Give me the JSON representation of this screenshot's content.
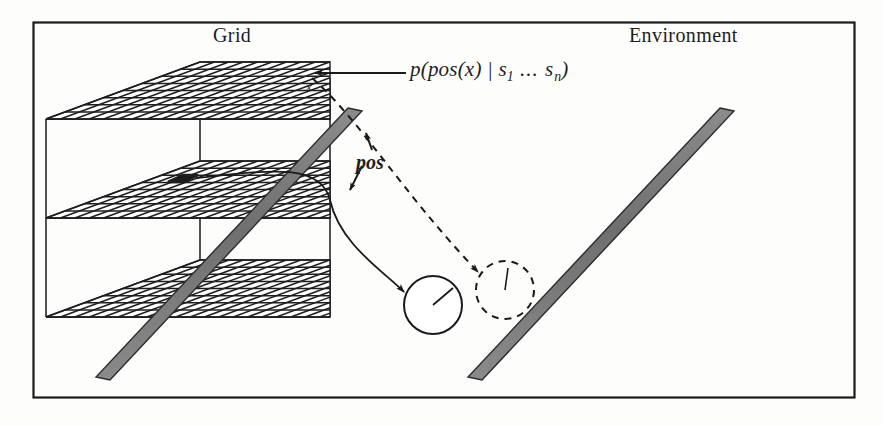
{
  "figure": {
    "panels": [
      {
        "id": "grid",
        "title": "Grid"
      },
      {
        "id": "environment",
        "title": "Environment"
      }
    ],
    "labels": {
      "probability_formula": {
        "lead": "p(pos(x) | s",
        "sub_first": "1",
        "mid": " ... s",
        "sub_last": "n",
        "tail": ")",
        "plain": "p(pos(x) | s1 ... sn)"
      },
      "pos": "pos",
      "x": "x"
    },
    "colors": {
      "frame_stroke": "#1a1a1a",
      "background": "#fdfdfb",
      "grid_line": "#222222",
      "wall_fill": "#7d7d7d",
      "wall_edge": "#2b2b2b",
      "highlight_cell": "#1c1c1c",
      "annotation_stroke": "#1a1a1a",
      "text": "#1d1d1d"
    },
    "geometry": {
      "frame": {
        "x": 33,
        "y": 22,
        "width": 822,
        "height": 376
      },
      "grid_planes": 3,
      "grid_columns": 10,
      "grid_rows": 8,
      "highlighted_cell": {
        "plane": "middle",
        "col": 4,
        "row": 4
      }
    },
    "elements": {
      "grid_stack": "three-stacked-occupancy-grid-planes",
      "highlight_cell": "dark-occupied-cell",
      "wall_grid": "diagonal-wall-obstacle-grid-panel",
      "wall_env": "diagonal-wall-obstacle-environment-panel",
      "robot_solid": "robot-position-marker",
      "robot_dashed": "hypothesized-robot-position-marker",
      "arrow_formula": "formula-pointer-arrow",
      "arrow_pos": "pos-double-headed-arrow",
      "curve_solid": "cell-to-robot-mapping-curve",
      "curve_dashed": "x-to-hypothesis-mapping-curve"
    }
  }
}
